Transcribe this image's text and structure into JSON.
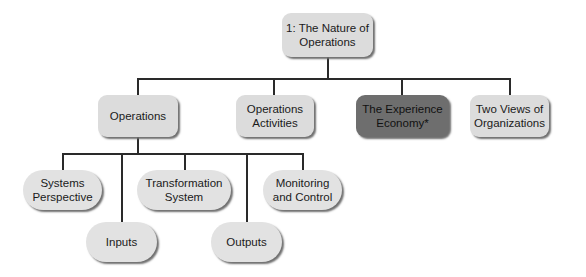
{
  "diagram": {
    "root": {
      "label": "1: The Nature of Operations"
    },
    "level2": [
      {
        "label": "Operations"
      },
      {
        "label": "Operations Activities"
      },
      {
        "label": "The Experience Economy*",
        "highlighted": true
      },
      {
        "label": "Two Views of Organizations"
      }
    ],
    "level3": [
      {
        "label": "Systems Perspective"
      },
      {
        "label": "Inputs"
      },
      {
        "label": "Transformation System"
      },
      {
        "label": "Outputs"
      },
      {
        "label": "Monitoring and Control"
      }
    ],
    "colors": {
      "box": "#dcdcdc",
      "highlight": "#6e6e6e",
      "line": "#2a2a2a"
    }
  }
}
